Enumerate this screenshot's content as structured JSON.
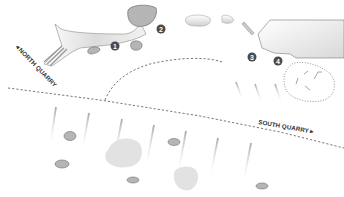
{
  "map": {
    "labels": {
      "north": "◄NORTH QUARRY",
      "south": "SOUTH QUARRY►"
    },
    "markers": [
      {
        "id": "1",
        "x": 115,
        "y": 46
      },
      {
        "id": "2",
        "x": 161,
        "y": 29
      },
      {
        "id": "3",
        "x": 252,
        "y": 57
      },
      {
        "id": "4",
        "x": 278,
        "y": 61
      }
    ],
    "colors": {
      "background": "#ffffff",
      "rock_fill": "#b9b9b9",
      "rock_stroke": "#6e6e6e",
      "marker_fill": "#4a4a4a",
      "dash_line": "#6a6a6a",
      "dot_line": "#888888",
      "pale_fill": "#e4e4e4"
    }
  }
}
